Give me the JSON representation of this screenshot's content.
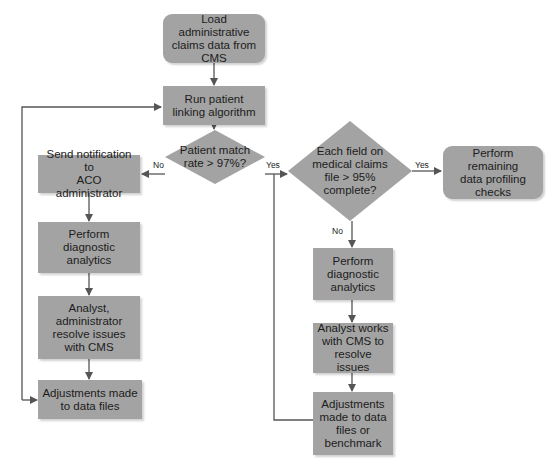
{
  "diagram": {
    "type": "flowchart",
    "colors": {
      "node_fill": "#a3a3a3",
      "line": "#555555",
      "text": "#1c1c1c",
      "background": "#ffffff"
    },
    "nodes": {
      "load": "Load administrative\nclaims data from\nCMS",
      "run": "Run patient\nlinking algorithm",
      "match_decision": "Patient match\nrate > 97%?",
      "send_notification": "Send notification to\nACO administrator",
      "diag_left": "Perform\ndiagnostic\nanalytics",
      "analyst_left": "Analyst,\nadministrator\nresolve issues\nwith CMS",
      "adjust_left": "Adjustments made\nto data files",
      "field_decision": "Each field on\nmedical claims\nfile > 95%\ncomplete?",
      "remaining": "Perform remaining\ndata profiling\nchecks",
      "diag_right": "Perform\ndiagnostic\nanalytics",
      "analyst_right": "Analyst works\nwith CMS to\nresolve issues",
      "adjust_right": "Adjustments\nmade to data\nfiles or\nbenchmark"
    },
    "labels": {
      "match_no": "No",
      "match_yes": "Yes",
      "field_yes": "Yes",
      "field_no": "No"
    },
    "edges": [
      {
        "from": "load",
        "to": "run"
      },
      {
        "from": "run",
        "to": "match_decision"
      },
      {
        "from": "match_decision",
        "to": "send_notification",
        "label": "No"
      },
      {
        "from": "match_decision",
        "to": "field_decision",
        "label": "Yes"
      },
      {
        "from": "send_notification",
        "to": "diag_left"
      },
      {
        "from": "diag_left",
        "to": "analyst_left"
      },
      {
        "from": "analyst_left",
        "to": "adjust_left"
      },
      {
        "from": "adjust_left",
        "to": "run"
      },
      {
        "from": "field_decision",
        "to": "remaining",
        "label": "Yes"
      },
      {
        "from": "field_decision",
        "to": "diag_right",
        "label": "No"
      },
      {
        "from": "diag_right",
        "to": "analyst_right"
      },
      {
        "from": "analyst_right",
        "to": "adjust_right"
      },
      {
        "from": "adjust_right",
        "to": "field_decision"
      }
    ]
  }
}
